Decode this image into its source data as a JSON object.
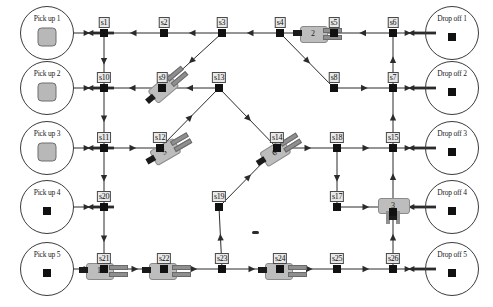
{
  "diagram": {
    "canvas": {
      "width": 493,
      "height": 307
    },
    "colors": {
      "background": "#ffffff",
      "line": "#2b2b2b",
      "node_fill": "#111111",
      "label_fill": "#e9e9e9",
      "label_border": "#4a4a4a",
      "machine_fill": "#bdbdbd",
      "machine_border": "#8a8a8a",
      "pallet_fill": "#b8b8b8"
    }
  },
  "stations": {
    "pickups": [
      {
        "id": "pickup-1",
        "label": "Pick up 1",
        "x": 47,
        "y": 33,
        "r": 26,
        "content": "pallet"
      },
      {
        "id": "pickup-2",
        "label": "Pick up 2",
        "x": 47,
        "y": 88,
        "r": 26,
        "content": "pallet"
      },
      {
        "id": "pickup-3",
        "label": "Pick up 3",
        "x": 47,
        "y": 148,
        "r": 26,
        "content": "pallet"
      },
      {
        "id": "pickup-4",
        "label": "Pick up 4",
        "x": 47,
        "y": 207,
        "r": 26,
        "content": "dot"
      },
      {
        "id": "pickup-5",
        "label": "Pick up 5",
        "x": 47,
        "y": 269,
        "r": 26,
        "content": "dot"
      }
    ],
    "dropoffs": [
      {
        "id": "dropoff-1",
        "label": "Drop off 1",
        "x": 452,
        "y": 33,
        "r": 26,
        "content": "dot"
      },
      {
        "id": "dropoff-2",
        "label": "Drop off 2",
        "x": 452,
        "y": 88,
        "r": 26,
        "content": "dot"
      },
      {
        "id": "dropoff-3",
        "label": "Drop off 3",
        "x": 452,
        "y": 148,
        "r": 26,
        "content": "dot"
      },
      {
        "id": "dropoff-4",
        "label": "Drop off 4",
        "x": 452,
        "y": 207,
        "r": 26,
        "content": "dot"
      },
      {
        "id": "dropoff-5",
        "label": "Drop off 5",
        "x": 452,
        "y": 269,
        "r": 26,
        "content": "dot"
      }
    ]
  },
  "nodes": [
    {
      "id": "s1",
      "label": "s1",
      "x": 104,
      "y": 33
    },
    {
      "id": "s2",
      "label": "s2",
      "x": 164,
      "y": 33
    },
    {
      "id": "s3",
      "label": "s3",
      "x": 222,
      "y": 33
    },
    {
      "id": "s4",
      "label": "s4",
      "x": 280,
      "y": 33
    },
    {
      "id": "s5",
      "label": "s5",
      "x": 334,
      "y": 33
    },
    {
      "id": "s6",
      "label": "s6",
      "x": 393,
      "y": 33
    },
    {
      "id": "s7",
      "label": "s7",
      "x": 393,
      "y": 88
    },
    {
      "id": "s8",
      "label": "s8",
      "x": 334,
      "y": 88
    },
    {
      "id": "s9",
      "label": "s9",
      "x": 162,
      "y": 88
    },
    {
      "id": "s10",
      "label": "s10",
      "x": 104,
      "y": 88
    },
    {
      "id": "s11",
      "label": "s11",
      "x": 104,
      "y": 148
    },
    {
      "id": "s12",
      "label": "s12",
      "x": 160,
      "y": 148
    },
    {
      "id": "s13",
      "label": "s13",
      "x": 219,
      "y": 88
    },
    {
      "id": "s14",
      "label": "s14",
      "x": 277,
      "y": 148
    },
    {
      "id": "s15",
      "label": "s15",
      "x": 393,
      "y": 148
    },
    {
      "id": "s17",
      "label": "s17",
      "x": 337,
      "y": 207
    },
    {
      "id": "s18",
      "label": "s18",
      "x": 337,
      "y": 148
    },
    {
      "id": "s19",
      "label": "s19",
      "x": 219,
      "y": 207
    },
    {
      "id": "s20",
      "label": "s20",
      "x": 104,
      "y": 207
    },
    {
      "id": "s21",
      "label": "s21",
      "x": 104,
      "y": 269
    },
    {
      "id": "s22",
      "label": "s22",
      "x": 164,
      "y": 269
    },
    {
      "id": "s23",
      "label": "s23",
      "x": 222,
      "y": 269
    },
    {
      "id": "s24",
      "label": "s24",
      "x": 280,
      "y": 269
    },
    {
      "id": "s25",
      "label": "s25",
      "x": 337,
      "y": 269
    },
    {
      "id": "s26",
      "label": "s26",
      "x": 393,
      "y": 269
    },
    {
      "id": "m3",
      "label": "3",
      "x": 393,
      "y": 207
    }
  ],
  "machines": [
    {
      "id": "machine-0",
      "number": "0",
      "at_node": "s9",
      "x": 162,
      "y": 88,
      "rotation": -40,
      "style": "arm"
    },
    {
      "id": "machine-2",
      "number": "2",
      "at_node": "s5",
      "x": 313,
      "y": 33,
      "rotation": 0,
      "style": "arm"
    },
    {
      "id": "machine-5",
      "number": "5",
      "at_node": "s12",
      "x": 164,
      "y": 151,
      "rotation": -30,
      "style": "arm"
    },
    {
      "id": "machine-6",
      "number": "6",
      "at_node": "s14",
      "x": 274,
      "y": 152,
      "rotation": -32,
      "style": "arm"
    },
    {
      "id": "machine-3",
      "number": "3",
      "at_node": "m3",
      "x": 393,
      "y": 205,
      "rotation": 0,
      "style": "legs"
    },
    {
      "id": "machine-1",
      "number": "1",
      "at_node": "s21",
      "x": 99,
      "y": 270,
      "rotation": 0,
      "style": "arm"
    },
    {
      "id": "machine-4",
      "number": "4",
      "at_node": "s22",
      "x": 162,
      "y": 270,
      "rotation": 0,
      "style": "arm"
    },
    {
      "id": "machine-7",
      "number": "7",
      "at_node": "s24",
      "x": 278,
      "y": 270,
      "rotation": 0,
      "style": "arm"
    }
  ],
  "edges": [
    {
      "from": "s1",
      "to": "pickup-1",
      "kind": "bidirectional"
    },
    {
      "from": "s2",
      "to": "s1",
      "kind": "directed"
    },
    {
      "from": "s3",
      "to": "s2",
      "kind": "directed"
    },
    {
      "from": "s4",
      "to": "s3",
      "kind": "directed"
    },
    {
      "from": "s5",
      "to": "s4",
      "kind": "directed"
    },
    {
      "from": "s6",
      "to": "s5",
      "kind": "directed"
    },
    {
      "from": "dropoff-1",
      "to": "s6",
      "kind": "bidirectional"
    },
    {
      "from": "s3",
      "to": "s9",
      "kind": "directed-diagonal"
    },
    {
      "from": "s4",
      "to": "s8",
      "kind": "directed-diagonal"
    },
    {
      "from": "s1",
      "to": "s10",
      "kind": "directed"
    },
    {
      "from": "s10",
      "to": "pickup-2",
      "kind": "bidirectional"
    },
    {
      "from": "s9",
      "to": "s10",
      "kind": "directed"
    },
    {
      "from": "s13",
      "to": "s9",
      "kind": "directed-diagonal"
    },
    {
      "from": "s8",
      "to": "s7",
      "kind": "directed"
    },
    {
      "from": "s7",
      "to": "s6",
      "kind": "directed-vertical"
    },
    {
      "from": "dropoff-2",
      "to": "s7",
      "kind": "bidirectional"
    },
    {
      "from": "s10",
      "to": "s11",
      "kind": "directed"
    },
    {
      "from": "s11",
      "to": "pickup-3",
      "kind": "bidirectional"
    },
    {
      "from": "s11",
      "to": "s12",
      "kind": "directed"
    },
    {
      "from": "s12",
      "to": "s13",
      "kind": "directed-diagonal"
    },
    {
      "from": "s13",
      "to": "s14",
      "kind": "directed-diagonal"
    },
    {
      "from": "s14",
      "to": "s18",
      "kind": "directed"
    },
    {
      "from": "s18",
      "to": "s15",
      "kind": "directed"
    },
    {
      "from": "s15",
      "to": "s7",
      "kind": "directed-vertical"
    },
    {
      "from": "dropoff-3",
      "to": "s15",
      "kind": "bidirectional"
    },
    {
      "from": "s11",
      "to": "s20",
      "kind": "directed"
    },
    {
      "from": "s20",
      "to": "pickup-4",
      "kind": "bidirectional"
    },
    {
      "from": "s18",
      "to": "s17",
      "kind": "directed"
    },
    {
      "from": "s17",
      "to": "m3",
      "kind": "directed"
    },
    {
      "from": "m3",
      "to": "s15",
      "kind": "directed-vertical"
    },
    {
      "from": "dropoff-4",
      "to": "m3",
      "kind": "bidirectional"
    },
    {
      "from": "s20",
      "to": "s21",
      "kind": "directed"
    },
    {
      "from": "s21",
      "to": "pickup-5",
      "kind": "bidirectional"
    },
    {
      "from": "s21",
      "to": "s22",
      "kind": "directed"
    },
    {
      "from": "s22",
      "to": "s23",
      "kind": "directed"
    },
    {
      "from": "s23",
      "to": "s19",
      "kind": "directed-vertical"
    },
    {
      "from": "s19",
      "to": "s14",
      "kind": "directed-diagonal"
    },
    {
      "from": "s23",
      "to": "s24",
      "kind": "directed"
    },
    {
      "from": "s24",
      "to": "s25",
      "kind": "directed"
    },
    {
      "from": "s25",
      "to": "s26",
      "kind": "directed"
    },
    {
      "from": "s26",
      "to": "m3",
      "kind": "directed-vertical"
    },
    {
      "from": "dropoff-5",
      "to": "s26",
      "kind": "bidirectional"
    }
  ]
}
